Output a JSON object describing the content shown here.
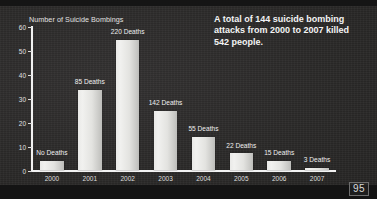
{
  "chart_data": {
    "type": "bar",
    "title": "",
    "ylabel": "Number of Suicide Bombings",
    "xlabel": "",
    "categories": [
      "2000",
      "2001",
      "2002",
      "2003",
      "2004",
      "2005",
      "2006",
      "2007"
    ],
    "values": [
      4,
      34,
      55,
      25,
      14,
      7,
      4,
      1
    ],
    "point_labels": [
      "No Deaths",
      "85 Deaths",
      "220 Deaths",
      "142 Deaths",
      "55 Deaths",
      "22 Deaths",
      "15 Deaths",
      "3 Deaths"
    ],
    "deaths": [
      0,
      85,
      220,
      142,
      55,
      22,
      15,
      3
    ],
    "ylim": [
      0,
      60
    ],
    "yticks": [
      "0",
      "10",
      "20",
      "30",
      "40",
      "50",
      "60"
    ],
    "ytick_values": [
      0,
      10,
      20,
      30,
      40,
      50,
      60
    ],
    "grid": false,
    "legend": "none",
    "bar_color": "#ececea",
    "background_color": "#2b2b2b",
    "text_color": "#e8e8e8"
  },
  "caption": {
    "text": "A total of 144 suicide bombing attacks from 2000 to 2007 killed 542 people."
  },
  "page_number": "95"
}
